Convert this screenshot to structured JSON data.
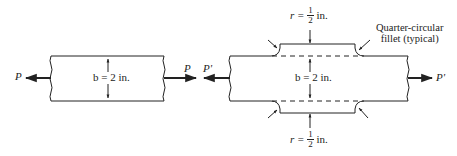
{
  "diagram": {
    "type": "engineering-bar-figure",
    "left_bar": {
      "force_left": "P",
      "force_right": "P",
      "width_label": "b = 2 in."
    },
    "right_bar": {
      "force_left": "P'",
      "force_right": "P'",
      "width_label": "b = 2 in.",
      "top_radius": {
        "var": "r =",
        "num": "1",
        "den": "2",
        "unit": "in."
      },
      "bottom_radius": {
        "var": "r =",
        "num": "1",
        "den": "2",
        "unit": "in."
      },
      "fillet_note_line1": "Quarter-circular",
      "fillet_note_line2": "fillet (typical)"
    },
    "colors": {
      "line": "#222222",
      "background": "#ffffff"
    }
  }
}
